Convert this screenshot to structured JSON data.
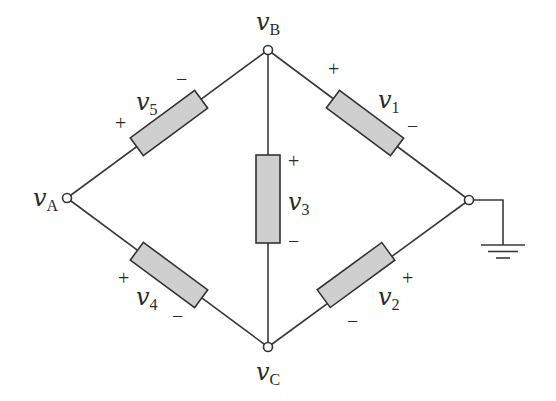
{
  "diagram": {
    "type": "circuit-bridge",
    "colors": {
      "wire": "#3a3a3a",
      "element_fill": "#cfcfcf",
      "element_stroke": "#333333",
      "text": "#2a2a2a",
      "background": "#ffffff"
    },
    "nodes": {
      "A": {
        "var": "v",
        "sub": "A"
      },
      "B": {
        "var": "v",
        "sub": "B"
      },
      "C": {
        "var": "v",
        "sub": "C"
      }
    },
    "elements": {
      "v1": {
        "var": "v",
        "sub": "1",
        "plus": "+",
        "minus": "−",
        "between": "B-ground"
      },
      "v2": {
        "var": "v",
        "sub": "2",
        "plus": "+",
        "minus": "−",
        "between": "ground-C"
      },
      "v3": {
        "var": "v",
        "sub": "3",
        "plus": "+",
        "minus": "−",
        "between": "B-C"
      },
      "v4": {
        "var": "v",
        "sub": "4",
        "plus": "+",
        "minus": "−",
        "between": "A-C"
      },
      "v5": {
        "var": "v",
        "sub": "5",
        "plus": "+",
        "minus": "−",
        "between": "A-B"
      }
    },
    "ground": {
      "symbol": "ground-icon"
    }
  }
}
